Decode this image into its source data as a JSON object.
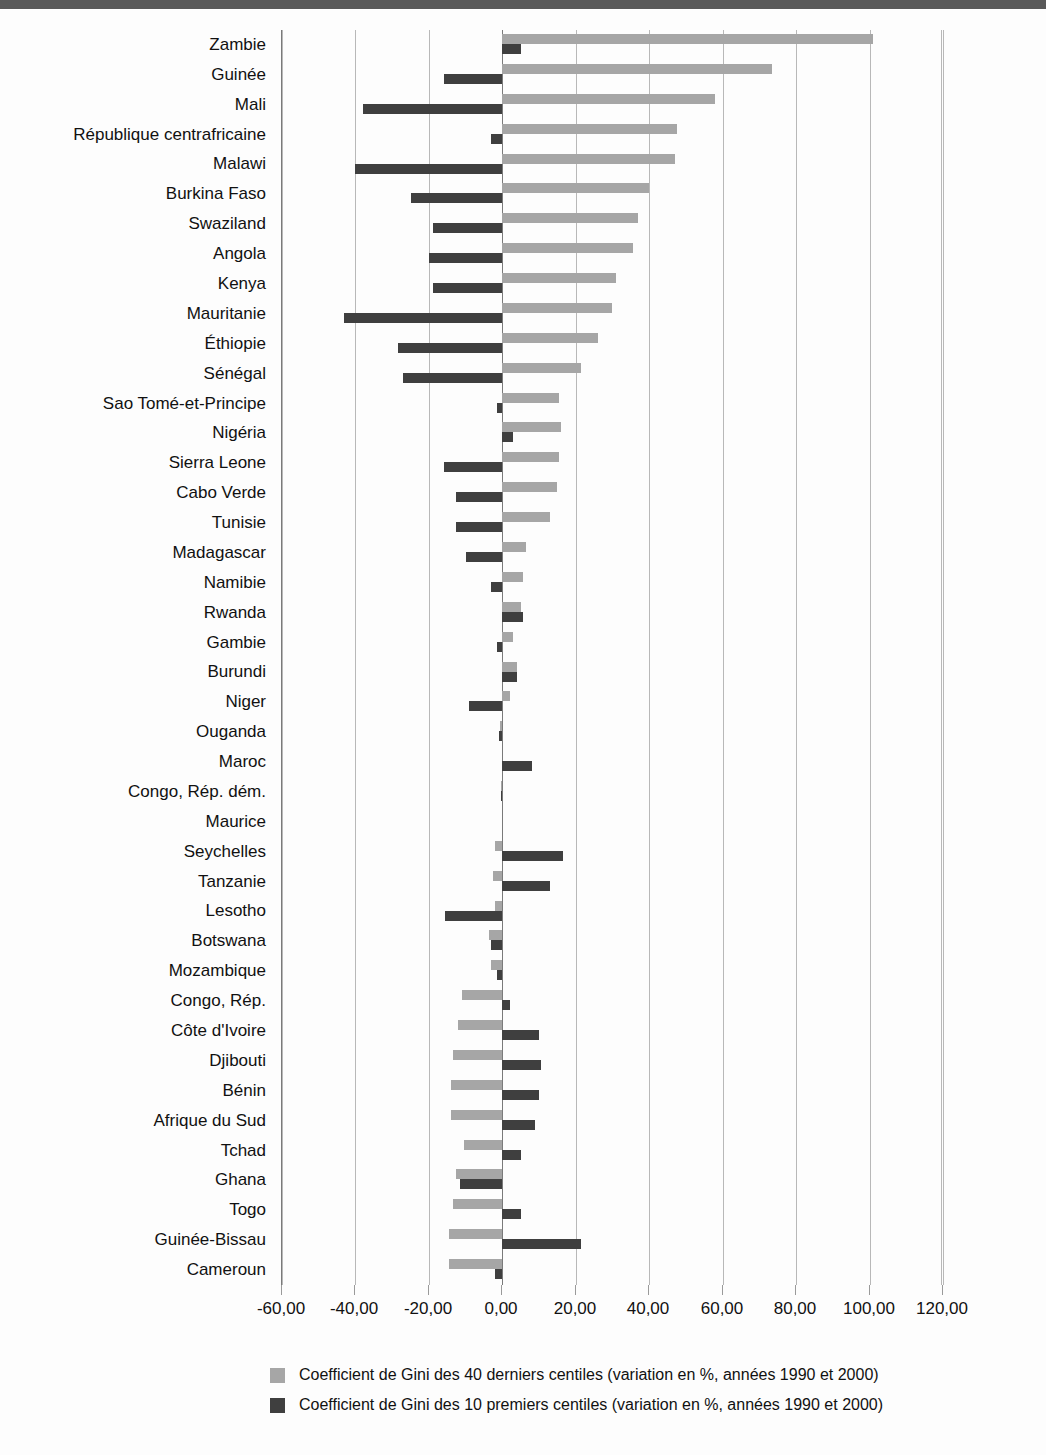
{
  "chart_data": {
    "type": "bar",
    "orientation": "horizontal",
    "title": "",
    "subtitle": "",
    "xlabel": "",
    "ylabel": "",
    "xlim": [
      -60,
      120
    ],
    "xticks": [
      -60,
      -40,
      -20,
      0,
      20,
      40,
      60,
      80,
      100,
      120
    ],
    "xtick_labels": [
      "-60,00",
      "-40,00",
      "-20,00",
      "0,00",
      "20,00",
      "40,00",
      "60,00",
      "80,00",
      "100,00",
      "120,00"
    ],
    "grid": true,
    "legend_position": "bottom",
    "categories": [
      "Zambie",
      "Guinée",
      "Mali",
      "République centrafricaine",
      "Malawi",
      "Burkina Faso",
      "Swaziland",
      "Angola",
      "Kenya",
      "Mauritanie",
      "Éthiopie",
      "Sénégal",
      "Sao Tomé-et-Principe",
      "Nigéria",
      "Sierra Leone",
      "Cabo Verde",
      "Tunisie",
      "Madagascar",
      "Namibie",
      "Rwanda",
      "Gambie",
      "Burundi",
      "Niger",
      "Ouganda",
      "Maroc",
      "Congo, Rép. dém.",
      "Maurice",
      "Seychelles",
      "Tanzanie",
      "Lesotho",
      "Botswana",
      "Mozambique",
      "Congo, Rép.",
      "Côte d'Ivoire",
      "Djibouti",
      "Bénin",
      "Afrique du Sud",
      "Tchad",
      "Ghana",
      "Togo",
      "Guinée-Bissau",
      "Cameroun"
    ],
    "series": [
      {
        "name": "Coefficient de Gini des 40 derniers centiles (variation en %, années 1990 et 2000)",
        "color": "#a6a6a6",
        "values": [
          101.0,
          73.5,
          58.0,
          47.5,
          47.0,
          40.0,
          37.0,
          35.5,
          31.0,
          30.0,
          26.0,
          21.5,
          15.5,
          16.0,
          15.5,
          15.0,
          13.0,
          6.5,
          5.5,
          5.0,
          3.0,
          4.0,
          2.0,
          -0.6,
          0.0,
          -0.4,
          0.0,
          -2.0,
          -2.5,
          -2.0,
          -3.5,
          -3.0,
          -11.0,
          -12.0,
          -13.5,
          -14.0,
          -14.0,
          -10.5,
          -12.5,
          -13.5,
          -14.5,
          -14.5
        ]
      },
      {
        "name": "Coefficient de Gini des 10 premiers centiles (variation en %, années 1990 et 2000)",
        "color": "#3f3f3f",
        "values": [
          5.0,
          -16.0,
          -38.0,
          -3.0,
          -40.0,
          -25.0,
          -19.0,
          -20.0,
          -19.0,
          -43.0,
          -28.5,
          -27.0,
          -1.5,
          3.0,
          -16.0,
          -12.5,
          -12.5,
          -10.0,
          -3.0,
          5.5,
          -1.5,
          4.0,
          -9.0,
          -1.0,
          8.0,
          -0.4,
          0.0,
          16.5,
          13.0,
          -15.5,
          -3.0,
          -1.5,
          2.0,
          10.0,
          10.5,
          10.0,
          9.0,
          5.0,
          -11.5,
          5.0,
          21.5,
          -2.0
        ]
      }
    ]
  },
  "legend": {
    "items": [
      {
        "label": "Coefficient de Gini des 40 derniers centiles (variation en %, années 1990 et 2000)",
        "swatch": "light-gray"
      },
      {
        "label": "Coefficient de Gini des 10 premiers centiles (variation en %, années 1990 et 2000)",
        "swatch": "dark-gray"
      }
    ]
  },
  "colors": {
    "series_top": "#a6a6a6",
    "series_bottom": "#3f3f3f",
    "grid": "#b8b8b8",
    "axis": "#7a7a7a",
    "top_band": "#595959",
    "background": "#fdfdfd"
  }
}
